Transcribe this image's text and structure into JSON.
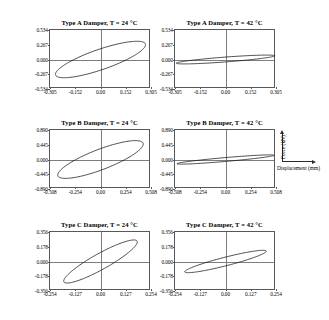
{
  "figure": {
    "kind": "hysteresis-loop-grid",
    "rows": 3,
    "columns": 2
  },
  "axis_key": {
    "y_label": "Force (kN)",
    "x_label": "Displacement (mm)"
  },
  "chart_data": [
    {
      "id": "panel-a-24",
      "type": "line",
      "title": "Type A Damper, T = 24 °C",
      "xlabel": "Displacement (mm)",
      "ylabel": "Force (kN)",
      "xlim": [
        -0.305,
        0.305
      ],
      "ylim": [
        -0.534,
        0.534
      ],
      "xticks": [
        "-0.305",
        "-0.152",
        "0.00",
        "0.152",
        "0.305"
      ],
      "xtick_values": [
        -0.305,
        -0.152,
        0.0,
        0.152,
        0.305
      ],
      "yticks": [
        "0.534",
        "0.267",
        "0.000",
        "-0.267",
        "-0.534"
      ],
      "ytick_values": [
        0.534,
        0.267,
        0.0,
        -0.267,
        -0.534
      ],
      "grid": true,
      "legend": "none",
      "loop": {
        "shape": "ellipse",
        "semi_major": 0.305,
        "semi_minor": 0.092,
        "rotation_deg": 33,
        "amplitude_x": 0.272,
        "amplitude_y": 0.33
      }
    },
    {
      "id": "panel-a-42",
      "type": "line",
      "title": "Type A Damper, T = 42 °C",
      "xlabel": "Displacement (mm)",
      "ylabel": "Force (kN)",
      "xlim": [
        -0.305,
        0.305
      ],
      "ylim": [
        -0.534,
        0.534
      ],
      "xticks": [
        "-0.305",
        "-0.152",
        "0.00",
        "0.152",
        "0.305"
      ],
      "xtick_values": [
        -0.305,
        -0.152,
        0.0,
        0.152,
        0.305
      ],
      "yticks": [
        "0.534",
        "0.267",
        "0.000",
        "-0.267",
        "-0.534"
      ],
      "ytick_values": [
        0.534,
        0.267,
        0.0,
        -0.267,
        -0.534
      ],
      "grid": true,
      "legend": "none",
      "loop": {
        "shape": "ellipse",
        "semi_major": 0.3,
        "semi_minor": 0.03,
        "rotation_deg": 9,
        "amplitude_x": 0.297,
        "amplitude_y": 0.08
      }
    },
    {
      "id": "panel-b-24",
      "type": "line",
      "title": "Type B Damper, T = 24 °C",
      "xlabel": "Displacement (mm)",
      "ylabel": "Force (kN)",
      "xlim": [
        -0.508,
        0.508
      ],
      "ylim": [
        -0.89,
        0.89
      ],
      "xticks": [
        "-0.508",
        "-0.254",
        "0.00",
        "0.254",
        "0.508"
      ],
      "xtick_values": [
        -0.508,
        -0.254,
        0.0,
        0.254,
        0.508
      ],
      "yticks": [
        "0.890",
        "0.445",
        "0.000",
        "-0.445",
        "-0.890"
      ],
      "ytick_values": [
        0.89,
        0.445,
        0.0,
        -0.445,
        -0.89
      ],
      "grid": true,
      "legend": "none",
      "loop": {
        "shape": "ellipse",
        "semi_major": 0.5,
        "semi_minor": 0.15,
        "rotation_deg": 35,
        "amplitude_x": 0.43,
        "amplitude_y": 0.57
      }
    },
    {
      "id": "panel-b-42",
      "type": "line",
      "title": "Type B Damper, T = 42 °C",
      "xlabel": "Displacement (mm)",
      "ylabel": "Force (kN)",
      "xlim": [
        -0.508,
        0.508
      ],
      "ylim": [
        -0.89,
        0.89
      ],
      "xticks": [
        "-0.508",
        "-0.254",
        "0.00",
        "0.254",
        "0.508"
      ],
      "xtick_values": [
        -0.508,
        -0.254,
        0.0,
        0.254,
        0.508
      ],
      "yticks": [
        "0.890",
        "0.445",
        "0.000",
        "-0.445",
        "-0.890"
      ],
      "ytick_values": [
        0.89,
        0.445,
        0.0,
        -0.445,
        -0.89
      ],
      "grid": true,
      "legend": "none",
      "loop": {
        "shape": "ellipse",
        "semi_major": 0.495,
        "semi_minor": 0.042,
        "rotation_deg": 11,
        "amplitude_x": 0.488,
        "amplitude_y": 0.14
      }
    },
    {
      "id": "panel-c-24",
      "type": "line",
      "title": "Type C Damper, T = 24 °C",
      "xlabel": "Displacement (mm)",
      "ylabel": "Force (kN)",
      "xlim": [
        -0.254,
        0.254
      ],
      "ylim": [
        -0.356,
        0.356
      ],
      "xticks": [
        "-0.254",
        "-0.127",
        "0.00",
        "0.127",
        "0.254"
      ],
      "xtick_values": [
        -0.254,
        -0.127,
        0.0,
        0.127,
        0.254
      ],
      "yticks": [
        "0.356",
        "0.178",
        "0.000",
        "-0.178",
        "-0.356"
      ],
      "ytick_values": [
        0.356,
        0.178,
        0.0,
        -0.178,
        -0.356
      ],
      "grid": true,
      "legend": "none",
      "loop": {
        "shape": "ellipse",
        "semi_major": 0.25,
        "semi_minor": 0.055,
        "rotation_deg": 44,
        "amplitude_x": 0.185,
        "amplitude_y": 0.26
      }
    },
    {
      "id": "panel-c-42",
      "type": "line",
      "title": "Type C Damper, T = 42 °C",
      "xlabel": "Displacement (mm)",
      "ylabel": "Force (kN)",
      "xlim": [
        -0.254,
        0.254
      ],
      "ylim": [
        -0.356,
        0.356
      ],
      "xticks": [
        "-0.254",
        "-0.127",
        "0.00",
        "0.127",
        "0.254"
      ],
      "xtick_values": [
        -0.254,
        -0.127,
        0.0,
        0.127,
        0.254
      ],
      "yticks": [
        "0.356",
        "0.178",
        "0.000",
        "-0.178",
        "-0.356"
      ],
      "ytick_values": [
        0.356,
        0.178,
        0.0,
        -0.178,
        -0.356
      ],
      "grid": true,
      "legend": "none",
      "loop": {
        "shape": "ellipse",
        "semi_major": 0.225,
        "semi_minor": 0.038,
        "rotation_deg": 27,
        "amplitude_x": 0.205,
        "amplitude_y": 0.135
      }
    }
  ],
  "colors": {
    "curve": "#111111",
    "frame": "#58585a",
    "axisline": "#7d7d80",
    "text": "#000000",
    "background": "#ffffff"
  }
}
